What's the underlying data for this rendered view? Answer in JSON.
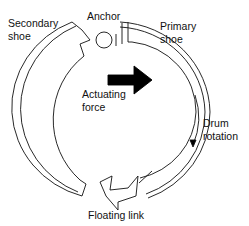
{
  "figure": {
    "type": "drum-brake-self-servo-diagram",
    "labels": {
      "secondary_shoe": "Secondary\nshoe",
      "anchor": "Anchor",
      "primary_shoe": "Primary\nshoe",
      "actuating_force": "Actuating\nforce",
      "drum_rotation": "Drum\nrotation",
      "floating_link": "Floating link"
    },
    "colors": {
      "line": "#111111",
      "background": "#ffffff",
      "force_arrow": "#000000"
    }
  }
}
